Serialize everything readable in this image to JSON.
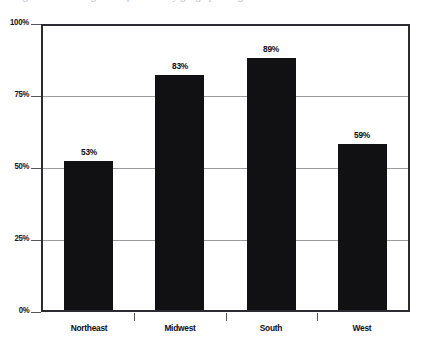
{
  "figure": {
    "top_cut_caption": "Figure 3. Percentage of respondents by geographic region"
  },
  "chart_data": {
    "type": "bar",
    "title": "",
    "xlabel": "",
    "ylabel": "",
    "categories": [
      "Northeast",
      "Midwest",
      "South",
      "West"
    ],
    "values": [
      53,
      83,
      89,
      59
    ],
    "value_labels": [
      "53%",
      "83%",
      "89%",
      "59%"
    ],
    "ylim": [
      0,
      100
    ],
    "ytick_values": [
      0,
      25,
      50,
      75,
      100
    ],
    "ytick_labels": [
      "0%",
      "25%",
      "50%",
      "75%",
      "100%"
    ],
    "grid": true,
    "legend": null,
    "series": [
      {
        "name": "Percentage",
        "values": [
          53,
          83,
          89,
          59
        ],
        "color": "#111114"
      }
    ]
  },
  "colors": {
    "bar": "#111114",
    "frame": "#2b2b31",
    "gridline": "#9a9aa0",
    "text": "#0d0d10",
    "background": "#ffffff"
  }
}
